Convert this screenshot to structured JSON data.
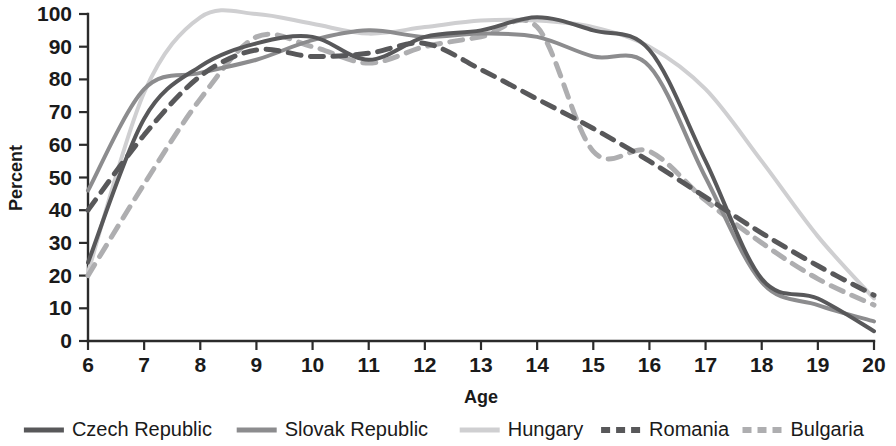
{
  "chart_data": {
    "type": "line",
    "title": "",
    "xlabel": "Age",
    "ylabel": "Percent",
    "xlim": [
      6,
      20
    ],
    "ylim": [
      0,
      100
    ],
    "grid": false,
    "legend_position": "bottom",
    "x": [
      6,
      7,
      8,
      9,
      10,
      11,
      12,
      13,
      14,
      15,
      16,
      17,
      18,
      19,
      20
    ],
    "xticks": [
      "6",
      "7",
      "8",
      "9",
      "10",
      "11",
      "12",
      "13",
      "14",
      "15",
      "16",
      "17",
      "18",
      "19",
      "20"
    ],
    "yticks": [
      "0",
      "10",
      "20",
      "30",
      "40",
      "50",
      "60",
      "70",
      "80",
      "90",
      "100"
    ],
    "series": [
      {
        "name": "Czech Republic",
        "color": "#58585a",
        "style": "solid",
        "width": 4,
        "values": [
          24,
          68,
          84,
          91,
          93,
          86,
          93,
          95,
          99,
          95,
          89,
          55,
          19,
          13,
          3
        ]
      },
      {
        "name": "Slovak Republic",
        "color": "#8c8c8e",
        "style": "solid",
        "width": 4,
        "values": [
          46,
          77,
          82,
          86,
          92,
          95,
          93,
          94,
          93,
          87,
          84,
          50,
          18,
          11,
          6
        ]
      },
      {
        "name": "Hungary",
        "color": "#cfcfd1",
        "style": "solid",
        "width": 4,
        "values": [
          21,
          76,
          99,
          100,
          97,
          94,
          96,
          98,
          98,
          96,
          90,
          77,
          55,
          32,
          13
        ]
      },
      {
        "name": "Romania",
        "color": "#58585a",
        "style": "dashed",
        "width": 5,
        "values": [
          40,
          63,
          81,
          89,
          87,
          88,
          91,
          83,
          74,
          65,
          55,
          44,
          33,
          23,
          14
        ]
      },
      {
        "name": "Bulgaria",
        "color": "#aeaeb0",
        "style": "dashed",
        "width": 5,
        "values": [
          20,
          48,
          74,
          93,
          90,
          85,
          90,
          93,
          96,
          58,
          58,
          43,
          30,
          19,
          11
        ]
      }
    ]
  },
  "legend": {
    "entries": [
      {
        "label": "Czech Republic"
      },
      {
        "label": "Slovak Republic"
      },
      {
        "label": "Hungary"
      },
      {
        "label": "Romania"
      },
      {
        "label": "Bulgaria"
      }
    ]
  }
}
